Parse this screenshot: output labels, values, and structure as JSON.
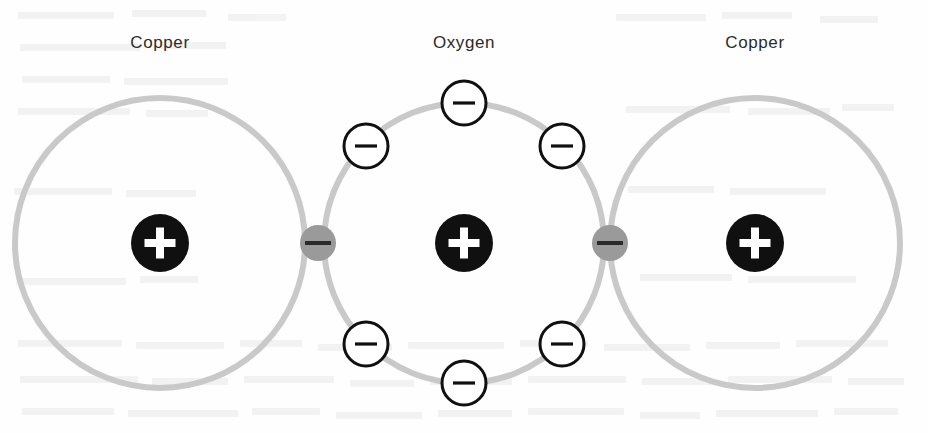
{
  "figure": {
    "width": 928,
    "height": 433,
    "background_color": "#fefefe"
  },
  "colors": {
    "orbital_ring": "#c9c9c9",
    "nucleus_fill": "#101010",
    "nucleus_symbol": "#ffffff",
    "electron_fill": "#ffffff",
    "electron_stroke": "#101010",
    "electron_symbol": "#101010",
    "shared_electron_fill": "#9a9a9a",
    "shared_electron_symbol": "#2a2a2a",
    "label_text": "#2b2b2b"
  },
  "geometry": {
    "orbital_stroke_width": 6,
    "nucleus_radius": 29,
    "electron_radius": 22,
    "electron_stroke_width": 3,
    "shared_electron_radius": 18
  },
  "labels": [
    {
      "id": "label-copper-left",
      "text": "Copper",
      "x": 160,
      "y": 33
    },
    {
      "id": "label-oxygen",
      "text": "Oxygen",
      "x": 464,
      "y": 33
    },
    {
      "id": "label-copper-right",
      "text": "Copper",
      "x": 755,
      "y": 33
    }
  ],
  "atoms": [
    {
      "id": "atom-copper-left",
      "element": "Copper",
      "symbol": "Cu",
      "nucleus_charge": "+",
      "center_x": 160,
      "center_y": 243,
      "orbital_radius": 145
    },
    {
      "id": "atom-oxygen",
      "element": "Oxygen",
      "symbol": "O",
      "nucleus_charge": "+",
      "center_x": 464,
      "center_y": 243,
      "orbital_radius": 140
    },
    {
      "id": "atom-copper-right",
      "element": "Copper",
      "symbol": "Cu",
      "nucleus_charge": "+",
      "center_x": 755,
      "center_y": 243,
      "orbital_radius": 145
    }
  ],
  "electrons": [
    {
      "id": "electron-oxygen-top-left",
      "charge": "−",
      "x": 366,
      "y": 146,
      "shared": false
    },
    {
      "id": "electron-oxygen-top-center",
      "charge": "−",
      "x": 464,
      "y": 103,
      "shared": false
    },
    {
      "id": "electron-oxygen-top-right",
      "charge": "−",
      "x": 562,
      "y": 146,
      "shared": false
    },
    {
      "id": "electron-oxygen-bottom-left",
      "charge": "−",
      "x": 366,
      "y": 344,
      "shared": false
    },
    {
      "id": "electron-oxygen-bottom-center",
      "charge": "−",
      "x": 464,
      "y": 383,
      "shared": false
    },
    {
      "id": "electron-oxygen-bottom-right",
      "charge": "−",
      "x": 562,
      "y": 344,
      "shared": false
    }
  ],
  "shared_electrons": [
    {
      "id": "shared-electron-left",
      "charge": "−",
      "x": 318,
      "y": 243,
      "between": [
        "Copper",
        "Oxygen"
      ]
    },
    {
      "id": "shared-electron-right",
      "charge": "−",
      "x": 610,
      "y": 243,
      "between": [
        "Oxygen",
        "Copper"
      ]
    }
  ],
  "ghost_text_marks": [
    {
      "x": 18,
      "y": 12,
      "w": 96
    },
    {
      "x": 132,
      "y": 10,
      "w": 74
    },
    {
      "x": 228,
      "y": 14,
      "w": 58
    },
    {
      "x": 20,
      "y": 44,
      "w": 120
    },
    {
      "x": 160,
      "y": 42,
      "w": 66
    },
    {
      "x": 22,
      "y": 76,
      "w": 88
    },
    {
      "x": 124,
      "y": 78,
      "w": 104
    },
    {
      "x": 18,
      "y": 108,
      "w": 112
    },
    {
      "x": 146,
      "y": 110,
      "w": 62
    },
    {
      "x": 616,
      "y": 14,
      "w": 90
    },
    {
      "x": 722,
      "y": 12,
      "w": 70
    },
    {
      "x": 820,
      "y": 16,
      "w": 58
    },
    {
      "x": 626,
      "y": 106,
      "w": 104
    },
    {
      "x": 748,
      "y": 108,
      "w": 82
    },
    {
      "x": 842,
      "y": 104,
      "w": 52
    },
    {
      "x": 14,
      "y": 188,
      "w": 98
    },
    {
      "x": 126,
      "y": 190,
      "w": 70
    },
    {
      "x": 628,
      "y": 186,
      "w": 86
    },
    {
      "x": 730,
      "y": 188,
      "w": 96
    },
    {
      "x": 16,
      "y": 278,
      "w": 110
    },
    {
      "x": 140,
      "y": 276,
      "w": 58
    },
    {
      "x": 640,
      "y": 274,
      "w": 92
    },
    {
      "x": 748,
      "y": 276,
      "w": 108
    },
    {
      "x": 18,
      "y": 340,
      "w": 104
    },
    {
      "x": 136,
      "y": 342,
      "w": 88
    },
    {
      "x": 240,
      "y": 340,
      "w": 62
    },
    {
      "x": 318,
      "y": 344,
      "w": 74
    },
    {
      "x": 408,
      "y": 342,
      "w": 96
    },
    {
      "x": 520,
      "y": 340,
      "w": 68
    },
    {
      "x": 604,
      "y": 344,
      "w": 86
    },
    {
      "x": 706,
      "y": 342,
      "w": 74
    },
    {
      "x": 796,
      "y": 340,
      "w": 92
    },
    {
      "x": 20,
      "y": 376,
      "w": 118
    },
    {
      "x": 152,
      "y": 378,
      "w": 76
    },
    {
      "x": 244,
      "y": 376,
      "w": 90
    },
    {
      "x": 350,
      "y": 380,
      "w": 64
    },
    {
      "x": 430,
      "y": 378,
      "w": 82
    },
    {
      "x": 528,
      "y": 376,
      "w": 98
    },
    {
      "x": 642,
      "y": 378,
      "w": 70
    },
    {
      "x": 728,
      "y": 376,
      "w": 104
    },
    {
      "x": 848,
      "y": 378,
      "w": 56
    },
    {
      "x": 22,
      "y": 408,
      "w": 92
    },
    {
      "x": 128,
      "y": 410,
      "w": 110
    },
    {
      "x": 252,
      "y": 408,
      "w": 68
    },
    {
      "x": 336,
      "y": 412,
      "w": 86
    },
    {
      "x": 438,
      "y": 410,
      "w": 74
    },
    {
      "x": 528,
      "y": 408,
      "w": 96
    },
    {
      "x": 640,
      "y": 412,
      "w": 60
    },
    {
      "x": 716,
      "y": 410,
      "w": 102
    },
    {
      "x": 834,
      "y": 408,
      "w": 64
    }
  ]
}
